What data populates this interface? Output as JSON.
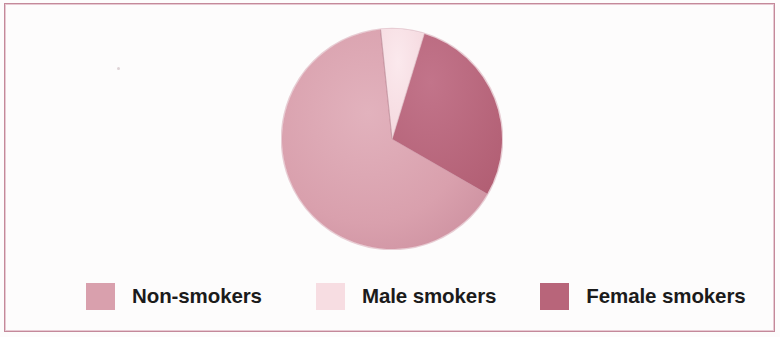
{
  "figure": {
    "background_color": "#fdfcfc",
    "frame_color": "#c4899a"
  },
  "legend": {
    "entries": [
      {
        "label": "Non-smokers",
        "color": "#d9a0ad",
        "swatch_name": "legend-swatch-non-smokers"
      },
      {
        "label": "Male smokers",
        "color": "#f7dde2",
        "swatch_name": "legend-swatch-male-smokers"
      },
      {
        "label": "Female smokers",
        "color": "#b8657a",
        "swatch_name": "legend-swatch-female-smokers"
      }
    ]
  },
  "chart_data": {
    "type": "pie",
    "title": "",
    "subtitle": "",
    "xlabel": "",
    "ylabel": "",
    "legend_position": "bottom",
    "grid": false,
    "start_angle_deg": -6,
    "direction": "clockwise",
    "categories": [
      "Male smokers",
      "Female smokers",
      "Non-smokers"
    ],
    "values": [
      6,
      29,
      65
    ],
    "value_unit": "percent",
    "slices": [
      {
        "label": "Male smokers",
        "value": 6,
        "color": "#f7dde2",
        "start_angle_deg": -6,
        "end_angle_deg": 17
      },
      {
        "label": "Female smokers",
        "value": 29,
        "color": "#b8657a",
        "start_angle_deg": 17,
        "end_angle_deg": 120
      },
      {
        "label": "Non-smokers",
        "value": 65,
        "color": "#d9a0ad",
        "start_angle_deg": 120,
        "end_angle_deg": 354
      }
    ],
    "data_labels_shown": false,
    "annotations": []
  }
}
